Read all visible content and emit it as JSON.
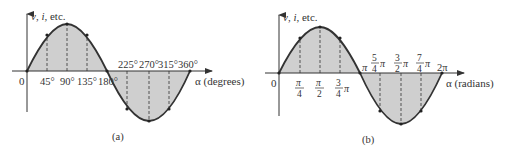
{
  "figure": {
    "colors": {
      "fill": "#cfcfcf",
      "curve": "#333333",
      "axis": "#333333",
      "dash": "#444444",
      "text": "#333333"
    },
    "panels": [
      {
        "id": "a",
        "caption": "(a)",
        "y_axis_label_parts": [
          "v",
          ", ",
          "i",
          ",  etc."
        ],
        "x_axis_label": "α (degrees)",
        "origin_label": "0",
        "ticks_upper": [
          "45°",
          "90°",
          "135°",
          "180°"
        ],
        "ticks_lower": [
          "225°",
          "270°",
          "315°",
          "360°"
        ]
      },
      {
        "id": "b",
        "caption": "(b)",
        "y_axis_label_parts": [
          "v",
          ", ",
          "i",
          ",  etc."
        ],
        "x_axis_label": "α (radians)",
        "origin_label": "0",
        "ticks_first_half": [
          {
            "num": "π",
            "den": "4",
            "suffix": ""
          },
          {
            "num": "π",
            "den": "2",
            "suffix": ""
          },
          {
            "num": "3",
            "den": "4",
            "suffix": "π"
          }
        ],
        "pi_label": "π",
        "ticks_second_half": [
          {
            "num": "5",
            "den": "4",
            "suffix": "π"
          },
          {
            "num": "3",
            "den": "2",
            "suffix": "π"
          },
          {
            "num": "7",
            "den": "4",
            "suffix": "π"
          }
        ],
        "two_pi_label": "2π"
      }
    ]
  }
}
